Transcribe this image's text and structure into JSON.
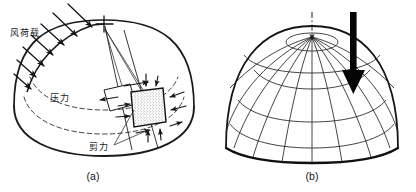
{
  "figure": {
    "background_color": "#ffffff",
    "ink_color": "#1a1a1a",
    "accent_color": "#000000",
    "width": 416,
    "height": 192,
    "style": "scanned hand-drawn engineering line diagram"
  },
  "panels": [
    {
      "id": "panel-a",
      "caption": "(a)",
      "subject": "dome-under-wind-load",
      "labels": [
        {
          "name": "wind-load-label",
          "text": "风荷载",
          "meaning": "wind load",
          "x": 10,
          "y": 36
        },
        {
          "name": "pressure-label",
          "text": "压力",
          "meaning": "pressure",
          "x": 50,
          "y": 101
        },
        {
          "name": "shear-label",
          "text": "剪力",
          "meaning": "shear force",
          "x": 89,
          "y": 150
        }
      ],
      "elements": {
        "stress_element": "stippled rectangular membrane element with inward normal arrows and tangential shear arrows",
        "latitude_circles": 2,
        "wind_arrows": 7,
        "leader_lines": 3,
        "apex_tick": "cross mark at crown"
      }
    },
    {
      "id": "panel-b",
      "caption": "(b)",
      "subject": "dome-mesh-under-vertical-load",
      "labels": [],
      "elements": {
        "meridians": 12,
        "parallels": 5,
        "load_arrow": "thick solid downward arrow",
        "center_axis": "dash-dot vertical centerline with small apex arrow"
      }
    }
  ],
  "captions": {
    "a": "(a)",
    "b": "(b)"
  }
}
